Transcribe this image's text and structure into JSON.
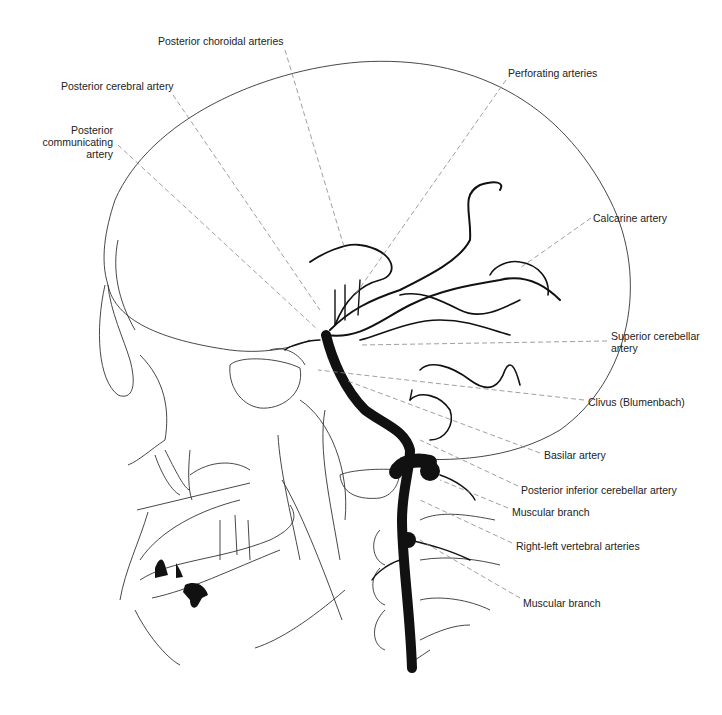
{
  "diagram": {
    "type": "anatomical illustration",
    "colors": {
      "background": "#ffffff",
      "ink": "#111111",
      "leader": "#888888",
      "text": "#222222"
    }
  },
  "labels": [
    {
      "id": "posterior-choroidal-arteries",
      "text": "Posterior choroidal arteries",
      "x": 158,
      "y": 35,
      "align": "left",
      "leader": [
        [
          285,
          50
        ],
        [
          345,
          250
        ]
      ]
    },
    {
      "id": "posterior-cerebral-artery",
      "text": "Posterior cerebral artery",
      "x": 61,
      "y": 80,
      "align": "left",
      "leader": [
        [
          173,
          95
        ],
        [
          320,
          310
        ]
      ]
    },
    {
      "id": "posterior-communicating-artery-1",
      "text": "Posterior",
      "x": 70,
      "y": 124,
      "align": "right",
      "w": 43,
      "leader": null
    },
    {
      "id": "posterior-communicating-artery-2",
      "text": "communicating",
      "x": 40,
      "y": 136,
      "align": "right",
      "w": 73,
      "leader": null
    },
    {
      "id": "posterior-communicating-artery-3",
      "text": "artery",
      "x": 70,
      "y": 148,
      "align": "right",
      "w": 43,
      "leader": [
        [
          118,
          145
        ],
        [
          318,
          330
        ]
      ]
    },
    {
      "id": "perforating-arteries",
      "text": "Perforating arteries",
      "x": 508,
      "y": 67,
      "align": "left",
      "leader": [
        [
          506,
          80
        ],
        [
          355,
          295
        ]
      ]
    },
    {
      "id": "calcarine-artery",
      "text": "Calcarine artery",
      "x": 593,
      "y": 212,
      "align": "left",
      "leader": [
        [
          591,
          218
        ],
        [
          520,
          268
        ]
      ]
    },
    {
      "id": "superior-cerebellar-artery-1",
      "text": "Superior cerebellar",
      "x": 611,
      "y": 330,
      "align": "left",
      "leader": [
        [
          607,
          341
        ],
        [
          360,
          345
        ]
      ]
    },
    {
      "id": "superior-cerebellar-artery-2",
      "text": "artery",
      "x": 611,
      "y": 342,
      "align": "left",
      "leader": null
    },
    {
      "id": "clivus",
      "text": "Clivus (Blumenbach)",
      "x": 588,
      "y": 396,
      "align": "left",
      "leader": [
        [
          584,
          400
        ],
        [
          318,
          370
        ]
      ]
    },
    {
      "id": "basilar-artery",
      "text": "Basilar artery",
      "x": 544,
      "y": 449,
      "align": "left",
      "leader": [
        [
          540,
          453
        ],
        [
          345,
          380
        ]
      ]
    },
    {
      "id": "posterior-inferior-cerebellar-artery",
      "text": "Posterior inferior cerebellar artery",
      "x": 521,
      "y": 484,
      "align": "left",
      "leader": [
        [
          518,
          486
        ],
        [
          420,
          440
        ]
      ]
    },
    {
      "id": "muscular-branch-1",
      "text": "Muscular branch",
      "x": 512,
      "y": 506,
      "align": "left",
      "leader": [
        [
          508,
          508
        ],
        [
          440,
          480
        ]
      ]
    },
    {
      "id": "right-left-vertebral-arteries",
      "text": "Right-left vertebral arteries",
      "x": 516,
      "y": 540,
      "align": "left",
      "leader": [
        [
          512,
          543
        ],
        [
          420,
          500
        ]
      ]
    },
    {
      "id": "muscular-branch-2",
      "text": "Muscular branch",
      "x": 523,
      "y": 597,
      "align": "left",
      "leader": [
        [
          520,
          598
        ],
        [
          420,
          540
        ]
      ]
    }
  ]
}
